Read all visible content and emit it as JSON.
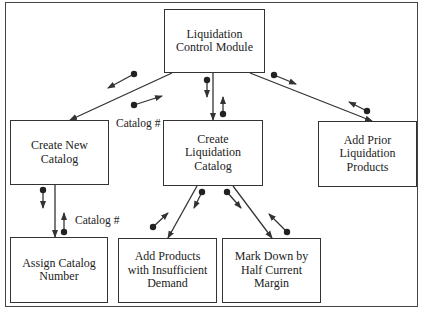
{
  "diagram": {
    "modules": {
      "root": {
        "lines": [
          "Liquidation",
          "Control Module"
        ]
      },
      "create_new_catalog": {
        "lines": [
          "Create New",
          "Catalog"
        ]
      },
      "create_liquidation_catalog": {
        "lines": [
          "Create",
          "Liquidation",
          "Catalog"
        ]
      },
      "add_prior": {
        "lines": [
          "Add Prior",
          "Liquidation",
          "Products"
        ]
      },
      "assign_catalog_number": {
        "lines": [
          "Assign Catalog",
          "Number"
        ]
      },
      "add_products": {
        "lines": [
          "Add Products",
          "with Insufficient",
          "Demand"
        ]
      },
      "mark_down": {
        "lines": [
          "Mark Down by",
          "Half Current",
          "Margin"
        ]
      }
    },
    "couple_labels": {
      "root_to_new_catalog": "Catalog #",
      "new_catalog_to_assign": "Catalog #"
    },
    "colors": {
      "line": "#333333",
      "text": "#222222",
      "background": "#ffffff"
    }
  }
}
